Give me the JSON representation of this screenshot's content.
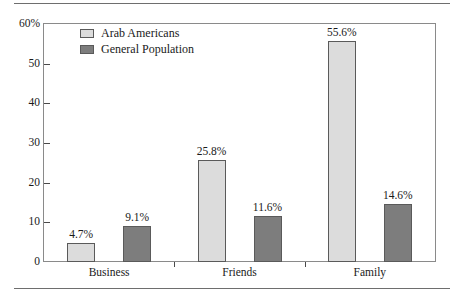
{
  "chart_data": {
    "type": "bar",
    "title": "",
    "subtitle": "",
    "xlabel": "",
    "ylabel": "",
    "categories": [
      "Business",
      "Friends",
      "Family"
    ],
    "series": [
      {
        "name": "Arab Americans",
        "color": "#dcdcdc",
        "values": [
          4.7,
          25.8,
          55.6
        ],
        "labels": [
          "4.7%",
          "25.8%",
          "55.6%"
        ]
      },
      {
        "name": "General Population",
        "color": "#7d7d7d",
        "values": [
          9.1,
          11.6,
          14.6
        ],
        "labels": [
          "9.1%",
          "11.6%",
          "14.6%"
        ]
      }
    ],
    "ylim": [
      0,
      60
    ],
    "yticks": [
      0,
      10,
      20,
      30,
      40,
      50,
      60
    ],
    "ytick_labels": [
      "0",
      "10",
      "20",
      "30",
      "40",
      "50",
      "60%"
    ],
    "grid": false,
    "legend_position": "top-left",
    "frame": true
  },
  "legend": {
    "entries": [
      {
        "label": "Arab Americans",
        "swatch": "light-gray-swatch"
      },
      {
        "label": "General Population",
        "swatch": "dark-gray-swatch"
      }
    ]
  }
}
